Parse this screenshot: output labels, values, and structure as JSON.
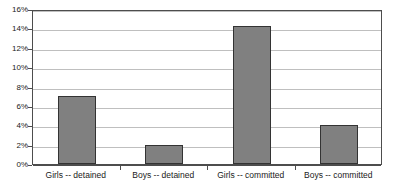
{
  "chart_data": {
    "type": "bar",
    "title": "",
    "xlabel": "",
    "ylabel": "",
    "categories": [
      "Girls -- detained",
      "Boys -- detained",
      "Girls -- committed",
      "Boys -- committed"
    ],
    "values": [
      7,
      2,
      14.2,
      4
    ],
    "value_labels": [
      "7%",
      "2%",
      "14.2%",
      "4%"
    ],
    "ylim": [
      0,
      16
    ],
    "ytick_values": [
      0,
      2,
      4,
      6,
      8,
      10,
      12,
      14,
      16
    ],
    "ytick_labels": [
      "0%",
      "2%",
      "4%",
      "6%",
      "8%",
      "10%",
      "12%",
      "14%",
      "16%"
    ],
    "grid": true,
    "legend": false,
    "legend_position": "none",
    "bar_color": "#808080",
    "bar_border_color": "#333333",
    "gridline_color": "#bfbfbf",
    "axis_color": "#4d4d4d",
    "background_color": "#ffffff"
  }
}
